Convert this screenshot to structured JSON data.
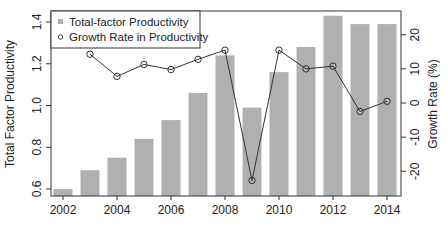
{
  "chart_data": {
    "type": "bar+line",
    "title": "",
    "xlabel": "",
    "ylabel": "Total Factor Productivity",
    "y2label": "Growth Rate (%)",
    "categories": [
      2002,
      2003,
      2004,
      2005,
      2006,
      2007,
      2008,
      2009,
      2010,
      2011,
      2012,
      2013,
      2014
    ],
    "x_ticks": [
      "2002",
      "2004",
      "2006",
      "2008",
      "2010",
      "2012",
      "2014"
    ],
    "ylim": [
      0.58,
      1.45
    ],
    "y_ticks": [
      "0.6",
      "0.8",
      "1.0",
      "1.2",
      "1.4"
    ],
    "y2lim": [
      -26,
      27
    ],
    "y2_ticks": [
      "-20",
      "-10",
      "0",
      "10",
      "20"
    ],
    "grid": false,
    "legend_position": "top-left",
    "series": [
      {
        "name": "Total-factor Productivity",
        "type": "bar",
        "axis": "left",
        "color": "#b0b0b0",
        "values": [
          0.6,
          0.69,
          0.75,
          0.84,
          0.93,
          1.06,
          1.24,
          0.99,
          1.16,
          1.28,
          1.43,
          1.39,
          1.39
        ]
      },
      {
        "name": "Growth Rate in Productivity",
        "type": "line",
        "axis": "right",
        "color": "#333333",
        "marker": "open-circle",
        "values": [
          null,
          14.3,
          7.8,
          11.3,
          9.8,
          12.8,
          15.5,
          -22.7,
          15.5,
          10.0,
          10.8,
          -2.5,
          0.5
        ]
      }
    ]
  },
  "legend": {
    "items": [
      {
        "label": "Total-factor Productivity",
        "symbol": "square"
      },
      {
        "label": "Growth Rate in Productivity",
        "symbol": "open-circle"
      }
    ]
  },
  "axes": {
    "left_label": "Total Factor Productivity",
    "right_label": "Growth Rate (%)"
  }
}
